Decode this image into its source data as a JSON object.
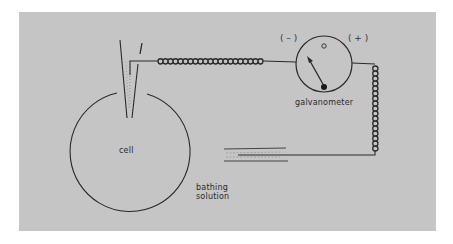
{
  "figure": {
    "background": "#c5c5c5",
    "ink": "#2a2a2a"
  },
  "labels": {
    "cell": "cell",
    "bathing_line1": "bathing",
    "bathing_line2": "solution",
    "galvanometer": "galvanometer",
    "negative": "( – )",
    "positive": "( + )",
    "zero_mark": "o"
  },
  "components": [
    {
      "name": "cell",
      "shape": "circle"
    },
    {
      "name": "microelectrode",
      "shape": "tapered glass pipette inserted into cell"
    },
    {
      "name": "galvanometer",
      "shape": "circular meter with needle deflected toward negative"
    },
    {
      "name": "reference-electrode",
      "shape": "horizontal electrode in bathing solution"
    },
    {
      "name": "wires",
      "shape": "coiled leads connecting electrodes to galvanometer"
    }
  ]
}
